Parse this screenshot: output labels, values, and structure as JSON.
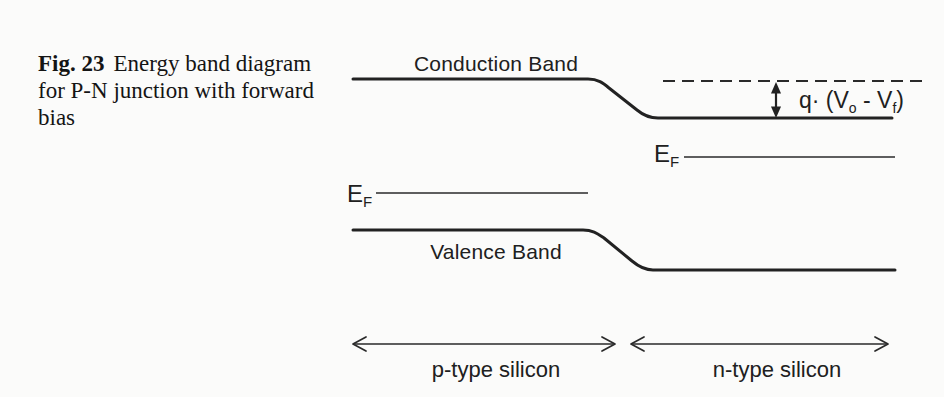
{
  "figure_caption": {
    "label": "Fig. 23",
    "text": "Energy band diagram for P-N junction with forward bias"
  },
  "diagram": {
    "conduction_band_label": "Conduction Band",
    "valence_band_label": "Valence Band",
    "fermi_level": {
      "main": "E",
      "sub": "F"
    },
    "potential_drop": {
      "part1": "q· (V",
      "sub1": "o",
      "part2": " - V",
      "sub2": "f",
      "part3": ")"
    },
    "p_region_label": "p-type silicon",
    "n_region_label": "n-type silicon"
  },
  "colors": {
    "line": "#222222",
    "text": "#1c1c1c",
    "background": "#fbfbfa"
  }
}
